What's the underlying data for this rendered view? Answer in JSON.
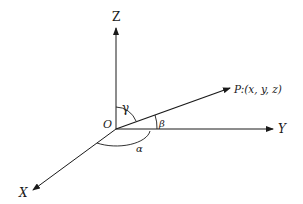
{
  "diagram": {
    "type": "3d-coordinate-direction-angles",
    "axes": {
      "z_label": "Z",
      "y_label": "Y",
      "x_label": "X"
    },
    "origin_label": "O",
    "point_label": "P:(x, y, z)",
    "angles": {
      "alpha": "α",
      "beta": "β",
      "gamma": "γ"
    },
    "colors": {
      "stroke": "#1a1a1a",
      "background": "#ffffff"
    }
  }
}
